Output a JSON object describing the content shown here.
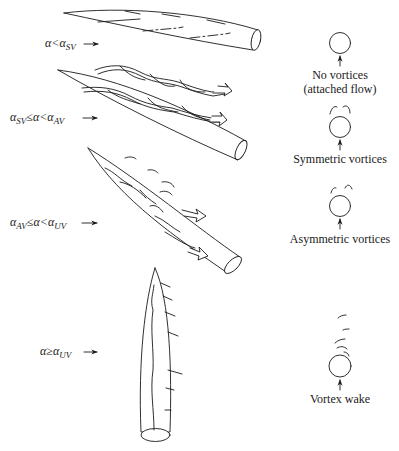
{
  "diagram": {
    "type": "flow-regimes-slender-body",
    "regimes": [
      {
        "condition": {
          "pre": "α",
          "op": "<",
          "post_sym": "α",
          "post_sub": "SV"
        },
        "condition_text": "α<α_SV",
        "cross_section_label": [
          "No vortices",
          "(attached flow)"
        ],
        "body_orientation": "near-horizontal, low incidence"
      },
      {
        "condition": {
          "lo_sym": "α",
          "lo_sub": "SV",
          "op1": "≤",
          "mid": "α",
          "op2": "<",
          "hi_sym": "α",
          "hi_sub": "AV"
        },
        "condition_text": "α_SV≤α<α_AV",
        "cross_section_label": [
          "Symmetric vortices"
        ],
        "body_orientation": "moderate incidence, twin intertwined vortices"
      },
      {
        "condition": {
          "lo_sym": "α",
          "lo_sub": "AV",
          "op1": "≤",
          "mid": "α",
          "op2": "<",
          "hi_sym": "α",
          "hi_sub": "UV"
        },
        "condition_text": "α_AV≤α<α_UV",
        "cross_section_label": [
          "Asymmetric vortices"
        ],
        "body_orientation": "high incidence, asymmetric vortex shedding"
      },
      {
        "condition": {
          "pre": "α",
          "op": "≥",
          "post_sym": "α",
          "post_sub": "UV"
        },
        "condition_text": "α≥α_UV",
        "cross_section_label": [
          "Vortex wake"
        ],
        "body_orientation": "near-vertical, unsteady vortex wake"
      }
    ],
    "icons": {
      "flow_arrow": "arrow-right-icon",
      "cross_section": "circle-icon",
      "flow_direction": "arrow-up-icon"
    },
    "colors": {
      "ink": "#1a1a1a",
      "background": "#ffffff"
    }
  }
}
